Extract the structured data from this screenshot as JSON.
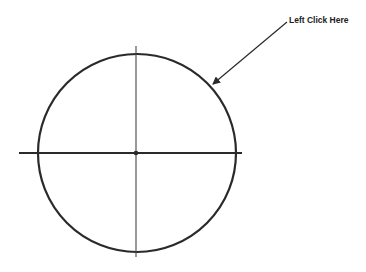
{
  "annotation": {
    "text": "Left Click Here"
  },
  "colors": {
    "background": "#ffffff",
    "stroke": "#2a2a2a",
    "text": "#222222"
  },
  "diagram": {
    "circle": {
      "cx": 137,
      "cy": 153,
      "r": 99
    },
    "horizontal_axis": {
      "x1": 19,
      "x2": 242,
      "y": 153
    },
    "vertical_axis": {
      "x": 136,
      "y1": 46,
      "y2": 257
    },
    "center_point": {
      "x": 136,
      "y": 153
    },
    "arrow": {
      "x1": 287,
      "y1": 22,
      "x2": 212,
      "y2": 85
    }
  }
}
